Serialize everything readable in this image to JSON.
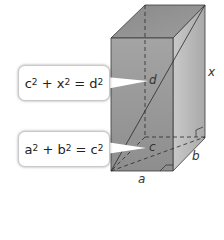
{
  "figure": {
    "type": "rectangular prism with space diagonal",
    "labels": {
      "height": "x",
      "space_diagonal": "d",
      "base_diagonal": "c",
      "depth": "b",
      "width": "a"
    },
    "callouts": [
      {
        "id": "space-diagonal-equation",
        "parts": [
          "c",
          "2",
          " + x",
          "2",
          " = d",
          "2"
        ],
        "text": "c² + x² = d²",
        "points_to": "d"
      },
      {
        "id": "base-diagonal-equation",
        "parts": [
          "a",
          "2",
          " + b",
          "2",
          " = c",
          "2"
        ],
        "text": "a² + b² = c²",
        "points_to": "c"
      }
    ]
  },
  "colors": {
    "front_face": "#9e9e9e",
    "top_face": "#8f8f8f",
    "right_face": "#bdbdbd",
    "edge": "#3a3a3a",
    "callout_bg": "#ffffff"
  }
}
